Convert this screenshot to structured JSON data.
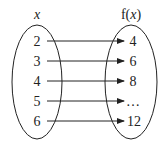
{
  "diagram": {
    "type": "function-mapping",
    "domain_label": "x",
    "codomain_label_prefix": "f(",
    "codomain_label_var": "x",
    "codomain_label_suffix": ")",
    "mappings": [
      {
        "input": "2",
        "output": "4"
      },
      {
        "input": "3",
        "output": "6"
      },
      {
        "input": "4",
        "output": "8"
      },
      {
        "input": "5",
        "output": "…"
      },
      {
        "input": "6",
        "output": "12"
      }
    ],
    "colors": {
      "stroke": "#222222",
      "background": "#ffffff"
    }
  }
}
